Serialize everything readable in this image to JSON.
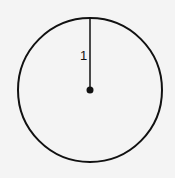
{
  "diagram": {
    "title": "",
    "circle": {
      "cx": 90,
      "cy": 90,
      "r": 72,
      "stroke": "#111111"
    },
    "radius_line": {
      "from": [
        90,
        90
      ],
      "to": [
        90,
        18
      ]
    },
    "center_point": {
      "cx": 90,
      "cy": 90
    },
    "radius_label": "1",
    "background": "#f4f4f4"
  }
}
